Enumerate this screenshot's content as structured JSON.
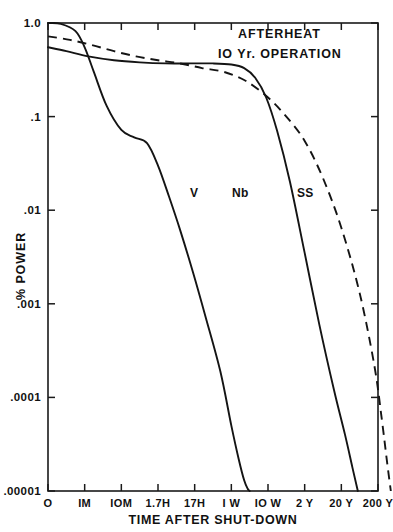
{
  "chart_data": {
    "type": "line",
    "title": "AFTERHEAT",
    "subtitle": "IO Yr.  OPERATION",
    "xlabel": "TIME AFTER SHUT-DOWN",
    "ylabel": "% POWER",
    "yscale": "log",
    "ylim": [
      1e-05,
      1.0
    ],
    "grid": false,
    "legend_position": "inline-curve-labels",
    "ytick_labels": [
      "1.0",
      ".1",
      ".01",
      ".001",
      ".0001",
      ".00001"
    ],
    "ytick_values": [
      1.0,
      0.1,
      0.01,
      0.001,
      0.0001,
      1e-05
    ],
    "xtick_labels": [
      "O",
      "IM",
      "IOM",
      "1.7H",
      "17H",
      "I W",
      "IO W",
      "2 Y",
      "20 Y",
      "200 Y"
    ],
    "xtick_index": [
      0,
      1,
      2,
      3,
      4,
      5,
      6,
      7,
      8,
      9
    ],
    "series": [
      {
        "name": "V",
        "style": "solid",
        "label": "V",
        "x": [
          0.0,
          0.35,
          0.75,
          1.0,
          1.25,
          1.6,
          2.0,
          2.35,
          2.7,
          3.0,
          3.3,
          3.6,
          3.95,
          4.3,
          4.7,
          5.0,
          5.2,
          5.35,
          5.45,
          5.5
        ],
        "y": [
          1.0,
          0.98,
          0.82,
          0.55,
          0.3,
          0.13,
          0.072,
          0.06,
          0.052,
          0.03,
          0.014,
          0.0062,
          0.0022,
          0.00072,
          0.00019,
          5e-05,
          2.2e-05,
          1.3e-05,
          1.05e-05,
          1e-05
        ]
      },
      {
        "name": "Nb",
        "style": "solid",
        "label": "Nb",
        "x": [
          0.0,
          0.5,
          1.1,
          1.8,
          2.5,
          3.2,
          3.9,
          4.5,
          5.0,
          5.35,
          5.65,
          5.95,
          6.25,
          6.6,
          7.0,
          7.4,
          7.8,
          8.1,
          8.3,
          8.45
        ],
        "y": [
          0.55,
          0.5,
          0.44,
          0.4,
          0.38,
          0.37,
          0.37,
          0.37,
          0.36,
          0.33,
          0.26,
          0.16,
          0.07,
          0.02,
          0.0035,
          0.0006,
          0.00012,
          4e-05,
          1.8e-05,
          1e-05
        ]
      },
      {
        "name": "SS",
        "style": "dashed",
        "label": "SS",
        "x": [
          0.0,
          0.6,
          1.2,
          1.8,
          2.4,
          3.0,
          3.6,
          4.2,
          4.8,
          5.4,
          6.0,
          6.5,
          7.0,
          7.5,
          8.0,
          8.5,
          8.9,
          9.1,
          9.25,
          9.35
        ],
        "y": [
          0.72,
          0.66,
          0.58,
          0.5,
          0.44,
          0.4,
          0.37,
          0.33,
          0.3,
          0.24,
          0.16,
          0.1,
          0.055,
          0.022,
          0.0065,
          0.0013,
          0.00022,
          6e-05,
          2e-05,
          1e-05
        ]
      }
    ]
  },
  "chart": {
    "title": "AFTERHEAT",
    "subtitle": "IO Yr.  OPERATION",
    "xlabel": "TIME AFTER SHUT-DOWN",
    "ylabel": "% POWER"
  }
}
